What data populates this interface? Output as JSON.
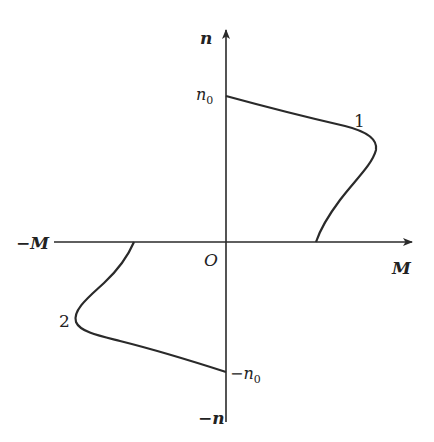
{
  "diagram": {
    "type": "interaction-curve",
    "axes": {
      "vertical": {
        "positive_label": "n",
        "negative_label": "−n"
      },
      "horizontal": {
        "positive_label": "M",
        "negative_label": "−M"
      },
      "origin_label": "O"
    },
    "ticks": {
      "n0_label": "n",
      "n0_sub": "0",
      "neg_n0_label": "−n",
      "neg_n0_sub": "0"
    },
    "curves": [
      {
        "id": "1",
        "label": "1",
        "quadrant": "I",
        "from": "n0 on n-axis",
        "to": "positive M-axis"
      },
      {
        "id": "2",
        "label": "2",
        "quadrant": "III",
        "from": "−M axis",
        "to": "−n0 on n-axis"
      }
    ],
    "colors": {
      "line": "#2a2a2a",
      "text": "#222222",
      "background": "#ffffff"
    }
  }
}
